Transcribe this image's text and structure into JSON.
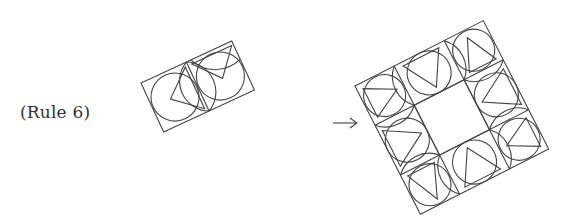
{
  "figure": {
    "rule_label": "(Rule 6)",
    "arrow_glyph": "→",
    "stroke_color": "#444444",
    "source_tile": {
      "description": "rotated 2x1 rectangle of two tiles, each with inscribed circle, triangle and arcs",
      "corners": [
        [
          141,
          83
        ],
        [
          232,
          41
        ],
        [
          254,
          90
        ],
        [
          161,
          132
        ]
      ]
    },
    "result_tile": {
      "description": "rotated 3x3 square ring of tiles with empty center",
      "corners": [
        [
          355,
          86
        ],
        [
          483,
          21
        ],
        [
          547,
          152
        ],
        [
          419,
          218
        ]
      ]
    }
  }
}
